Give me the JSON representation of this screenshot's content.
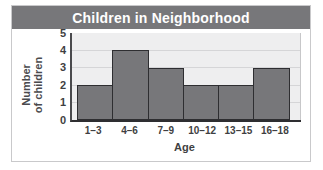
{
  "chart_data": {
    "type": "bar",
    "title": "Children in Neighborhood",
    "xlabel": "Age",
    "ylabel_line1": "Number",
    "ylabel_line2": "of children",
    "categories": [
      "1–3",
      "4–6",
      "7–9",
      "10–12",
      "13–15",
      "16–18"
    ],
    "values": [
      2,
      4,
      3,
      2,
      2,
      3
    ],
    "yticks": [
      5,
      4,
      3,
      2,
      1,
      0
    ],
    "ylim": [
      0,
      5
    ],
    "grid": true,
    "legend": "none",
    "colors": {
      "bar_fill": "#77777a",
      "bar_border": "#2e2e31",
      "plot_background": "#eeeeef",
      "title_bar": "#77777a",
      "title_text": "#ffffff",
      "axis": "#2e2e31",
      "gridline": "#d5d5d7",
      "frame": "#c9c9cb"
    }
  }
}
